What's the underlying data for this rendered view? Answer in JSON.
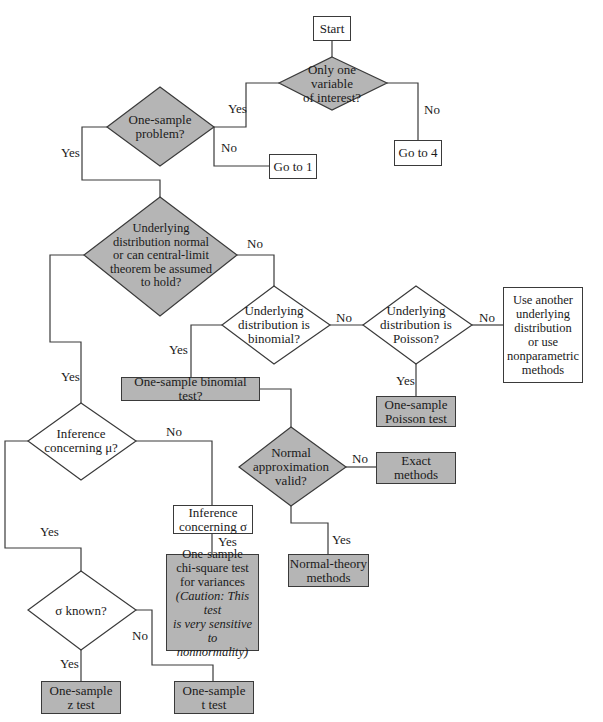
{
  "colors": {
    "shaded_fill": "#b5b5b5",
    "line": "#3a3a3a",
    "background": "#ffffff"
  },
  "nodes": {
    "start": "Start",
    "only_one_variable": "Only one\nvariable\nof interest?",
    "go_to_4": "Go to 4",
    "one_sample_problem": "One-sample\nproblem?",
    "go_to_1": "Go to 1",
    "underlying_normal": "Underlying\ndistribution normal\nor can central-limit\ntheorem be assumed\nto hold?",
    "binomial": "Underlying\ndistribution is\nbinomial?",
    "poisson": "Underlying\ndistribution is\nPoisson?",
    "use_another": "Use another\nunderlying\ndistribution\nor use\nnonparametric\nmethods",
    "binomial_test": "One-sample binomial test?",
    "poisson_test": "One-sample\nPoisson test",
    "inference_mu": "Inference\nconcerning μ?",
    "normal_approx": "Normal\napproximation\nvalid?",
    "exact_methods": "Exact\nmethods",
    "inference_sigma": "Inference\nconcerning σ",
    "normal_theory": "Normal-theory\nmethods",
    "chi_square_main": "One-sample\nchi-square test\nfor variances",
    "chi_square_caution": "(Caution: This test\nis very sensitive to\nnonnormality)",
    "sigma_known": "σ known?",
    "z_test": "One-sample\nz test",
    "t_test": "One-sample\nt test"
  },
  "edge_labels": {
    "only_one_yes": "Yes",
    "only_one_no": "No",
    "one_sample_yes": "Yes",
    "one_sample_no": "No",
    "normal_yes": "Yes",
    "normal_no": "No",
    "binomial_yes": "Yes",
    "binomial_no": "No",
    "poisson_yes": "Yes",
    "poisson_no": "No",
    "approx_no": "No",
    "approx_yes": "Yes",
    "mu_no": "No",
    "mu_yes": "Yes",
    "sigma_yes": "Yes",
    "known_yes": "Yes",
    "known_no": "No"
  }
}
